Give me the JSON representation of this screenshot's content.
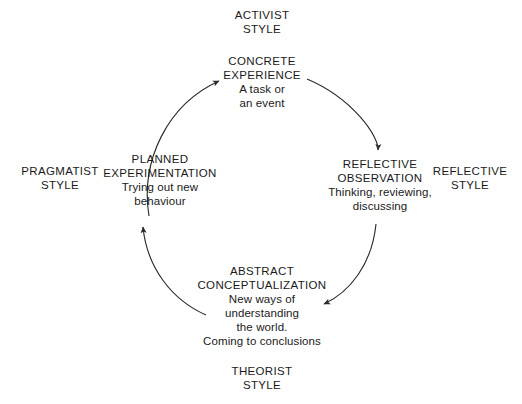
{
  "diagram": {
    "stroke_color": "#2b2b2b",
    "background_color": "#ffffff",
    "text_color": "#1a1a1a",
    "center": {
      "x": 261,
      "y": 196
    },
    "radius": 118,
    "stages": [
      {
        "id": "concrete-experience",
        "title_lines": [
          "CONCRETE",
          "EXPERIENCE"
        ],
        "desc_lines": [
          "A task or",
          "an event"
        ],
        "position": "top"
      },
      {
        "id": "reflective-observation",
        "title_lines": [
          "REFLECTIVE",
          "OBSERVATION"
        ],
        "desc_lines": [
          "Thinking, reviewing,",
          "discussing"
        ],
        "position": "right"
      },
      {
        "id": "abstract-conceptualization",
        "title_lines": [
          "ABSTRACT",
          "CONCEPTUALIZATION"
        ],
        "desc_lines": [
          "New ways of",
          "understanding",
          "the world.",
          "Coming to conclusions"
        ],
        "position": "bottom"
      },
      {
        "id": "planned-experimentation",
        "title_lines": [
          "PLANNED",
          "EXPERIMENTATION"
        ],
        "desc_lines": [
          "Trying out new",
          "behaviour"
        ],
        "position": "left"
      }
    ],
    "styles": [
      {
        "id": "activist",
        "lines": [
          "ACTIVIST",
          "STYLE"
        ],
        "position": "top"
      },
      {
        "id": "reflective",
        "lines": [
          "REFLECTIVE",
          "STYLE"
        ],
        "position": "right"
      },
      {
        "id": "theorist",
        "lines": [
          "THEORIST",
          "STYLE"
        ],
        "position": "bottom"
      },
      {
        "id": "pragmatist",
        "lines": [
          "PRAGMATIST",
          "STYLE"
        ],
        "position": "left"
      }
    ],
    "arrows": [
      {
        "id": "planned-to-concrete",
        "direction": "clockwise",
        "from": "planned-experimentation",
        "to": "concrete-experience"
      },
      {
        "id": "concrete-to-reflective",
        "direction": "clockwise",
        "from": "concrete-experience",
        "to": "reflective-observation"
      },
      {
        "id": "reflective-to-abstract",
        "direction": "clockwise",
        "from": "reflective-observation",
        "to": "abstract-conceptualization"
      },
      {
        "id": "abstract-to-planned",
        "direction": "clockwise",
        "from": "abstract-conceptualization",
        "to": "planned-experimentation"
      }
    ]
  }
}
